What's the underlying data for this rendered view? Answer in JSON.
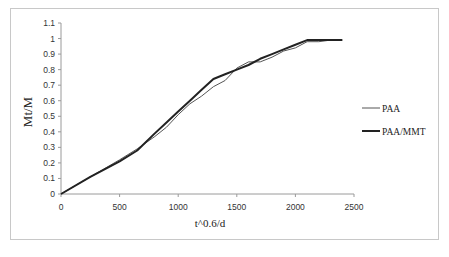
{
  "chart_data": {
    "type": "line",
    "title": "",
    "xlabel": "t^0.6/d",
    "ylabel": "Mt/M",
    "xlim": [
      0,
      2500
    ],
    "ylim": [
      0,
      1.1
    ],
    "x_ticks": [
      "0",
      "500",
      "1000",
      "1500",
      "2000",
      "2500"
    ],
    "y_ticks": [
      "0",
      "0.1",
      "0.2",
      "0.3",
      "0.4",
      "0.5",
      "0.6",
      "0.7",
      "0.8",
      "0.9",
      "1",
      "1.1"
    ],
    "grid": false,
    "legend_position": "right",
    "series": [
      {
        "name": "PAA",
        "color": "#555555",
        "line_width": 1,
        "x": [
          0,
          250,
          500,
          650,
          800,
          900,
          1000,
          1100,
          1200,
          1300,
          1400,
          1500,
          1600,
          1700,
          1800,
          1900,
          2000,
          2100,
          2200,
          2300,
          2400
        ],
        "y": [
          0,
          0.11,
          0.22,
          0.29,
          0.37,
          0.43,
          0.51,
          0.58,
          0.63,
          0.69,
          0.73,
          0.81,
          0.85,
          0.85,
          0.88,
          0.92,
          0.94,
          0.98,
          0.98,
          0.99,
          0.99
        ]
      },
      {
        "name": "PAA/MMT",
        "color": "#222222",
        "line_width": 2,
        "x": [
          0,
          250,
          500,
          650,
          800,
          900,
          1000,
          1100,
          1200,
          1300,
          1400,
          1500,
          1600,
          1700,
          1800,
          1900,
          2000,
          2100,
          2200,
          2300,
          2400
        ],
        "y": [
          0,
          0.11,
          0.21,
          0.28,
          0.39,
          0.46,
          0.53,
          0.6,
          0.67,
          0.74,
          0.77,
          0.8,
          0.83,
          0.87,
          0.9,
          0.93,
          0.96,
          0.99,
          0.99,
          0.99,
          0.99
        ]
      }
    ]
  }
}
